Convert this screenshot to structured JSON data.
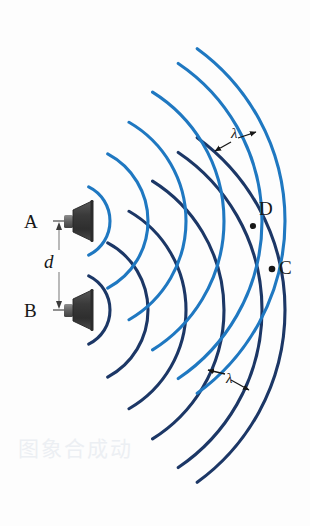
{
  "figure": {
    "width": 310,
    "height": 526,
    "background_color": "#fdfdfd"
  },
  "colors": {
    "wavefront_light_blue": "#1f78c1",
    "wavefront_dark_blue": "#1c3766",
    "label_black": "#171717",
    "dimension_line_gray": "#8d8d8d",
    "speaker_dark": "#3c3c3c",
    "speaker_mid": "#5a5a5a",
    "speaker_light": "#7e7e7e",
    "watermark": "#eceff3"
  },
  "sources": [
    {
      "label": "A",
      "name": "speaker-a",
      "label_x": 24,
      "label_y": 212,
      "center_x": 72,
      "center_y": 221,
      "wave_color_key": "wavefront_light_blue"
    },
    {
      "label": "B",
      "name": "speaker-b",
      "label_x": 24,
      "label_y": 301,
      "center_x": 72,
      "center_y": 310,
      "wave_color_key": "wavefront_dark_blue"
    }
  ],
  "separation": {
    "label": "d",
    "label_x": 44,
    "label_y": 260,
    "arrow_x": 59,
    "arrow_top_y": 224,
    "arrow_bottom_y": 307
  },
  "points": [
    {
      "label": "D",
      "name": "point-d",
      "dot_x": 253,
      "dot_y": 226,
      "label_x": 259,
      "label_y": 200
    },
    {
      "label": "C",
      "name": "point-c",
      "dot_x": 272,
      "dot_y": 269,
      "label_x": 279,
      "label_y": 259
    }
  ],
  "wavelength_labels": [
    {
      "symbol": "λ",
      "name": "wavelength-label-upper",
      "label_x": 233,
      "label_y": 133,
      "arrow_left_x": 222,
      "arrow_left_y": 152,
      "arrow_right_x": 254,
      "arrow_right_y": 139
    },
    {
      "symbol": "λ",
      "name": "wavelength-label-lower",
      "label_x": 229,
      "label_y": 381,
      "arrow_left_x": 212,
      "arrow_left_y": 376,
      "arrow_right_x": 251,
      "arrow_right_y": 391
    }
  ],
  "wavefronts": {
    "source_a": {
      "center_x": 72,
      "center_y": 221,
      "color_key": "wavefront_light_blue",
      "stroke_width": 3.1,
      "arc_span_degrees": 128,
      "radii": [
        38,
        76,
        114,
        152,
        190,
        213
      ]
    },
    "source_b": {
      "center_x": 72,
      "center_y": 310,
      "color_key": "wavefront_dark_blue",
      "stroke_width": 3.1,
      "arc_span_degrees": 128,
      "radii": [
        38,
        76,
        114,
        152,
        190,
        213
      ]
    }
  },
  "chart_data": {
    "type": "line",
    "xlabel": "",
    "ylabel": "",
    "series": [
      {
        "name": "Wavefronts from speaker A",
        "color": "#1f78c1",
        "center": [
          72,
          221
        ],
        "values": [
          38,
          76,
          114,
          152,
          190,
          213
        ]
      },
      {
        "name": "Wavefronts from speaker B",
        "color": "#1c3766",
        "center": [
          72,
          310
        ],
        "values": [
          38,
          76,
          114,
          152,
          190,
          213
        ]
      }
    ],
    "annotations": [
      {
        "text": "A",
        "x": 24,
        "y": 212
      },
      {
        "text": "B",
        "x": 24,
        "y": 301
      },
      {
        "text": "d",
        "x": 44,
        "y": 260
      },
      {
        "text": "D",
        "x": 259,
        "y": 200
      },
      {
        "text": "C",
        "x": 279,
        "y": 259
      },
      {
        "text": "λ",
        "x": 233,
        "y": 133
      },
      {
        "text": "λ",
        "x": 229,
        "y": 381
      }
    ],
    "grid": false,
    "legend": "none"
  },
  "watermark": {
    "text": "图象合成动",
    "x": 18,
    "y": 432
  }
}
